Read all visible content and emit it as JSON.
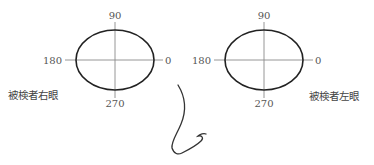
{
  "diagram": {
    "type": "ocular-axis-diagram",
    "colors": {
      "ellipse": "#222222",
      "axis": "#888888",
      "label": "#555555",
      "nose": "#333333"
    },
    "eyes": [
      {
        "id": "right-eye",
        "caption": "被検者右眼",
        "labels": {
          "top": "90",
          "left": "180",
          "right": "0",
          "bottom": "270"
        }
      },
      {
        "id": "left-eye",
        "caption": "被検者左眼",
        "labels": {
          "top": "90",
          "left": "180",
          "right": "0",
          "bottom": "270"
        }
      }
    ]
  }
}
